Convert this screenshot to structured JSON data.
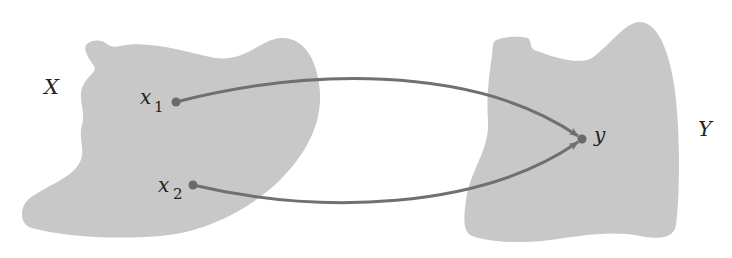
{
  "diagram": {
    "type": "function-mapping",
    "colors": {
      "set_fill": "#c8c8c8",
      "arrow": "#707070",
      "point": "#6a6a6a",
      "text": "#222222",
      "background": "#ffffff"
    },
    "sets": [
      {
        "id": "X",
        "label": "X"
      },
      {
        "id": "Y",
        "label": "Y"
      }
    ],
    "points": [
      {
        "id": "x1",
        "base": "x",
        "subscript": "1",
        "set": "X"
      },
      {
        "id": "x2",
        "base": "x",
        "subscript": "2",
        "set": "X"
      },
      {
        "id": "y",
        "base": "y",
        "subscript": "",
        "set": "Y"
      }
    ],
    "arrows": [
      {
        "from": "x1",
        "to": "y"
      },
      {
        "from": "x2",
        "to": "y"
      }
    ]
  }
}
